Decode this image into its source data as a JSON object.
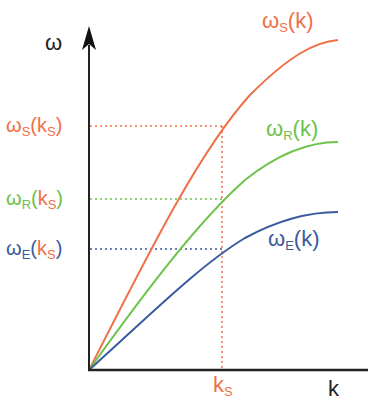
{
  "colors": {
    "axis": "#222222",
    "S": "#f07048",
    "R": "#6cc24a",
    "E": "#3a5aa0"
  },
  "axes": {
    "y_label": "ω",
    "x_label": "k"
  },
  "ticks": {
    "x": {
      "main": "k",
      "sub": "S"
    },
    "y": [
      {
        "omega": "ω",
        "sub": "S",
        "open": "(",
        "k": "k",
        "ksub": "S",
        "close": ")"
      },
      {
        "omega": "ω",
        "sub": "R",
        "open": "(",
        "k": "k",
        "ksub": "S",
        "close": ")"
      },
      {
        "omega": "ω",
        "sub": "E",
        "open": "(",
        "k": "k",
        "ksub": "S",
        "close": ")"
      }
    ]
  },
  "curves": [
    {
      "omega": "ω",
      "sub": "S",
      "arg": "(k)"
    },
    {
      "omega": "ω",
      "sub": "R",
      "arg": "(k)"
    },
    {
      "omega": "ω",
      "sub": "E",
      "arg": "(k)"
    }
  ]
}
